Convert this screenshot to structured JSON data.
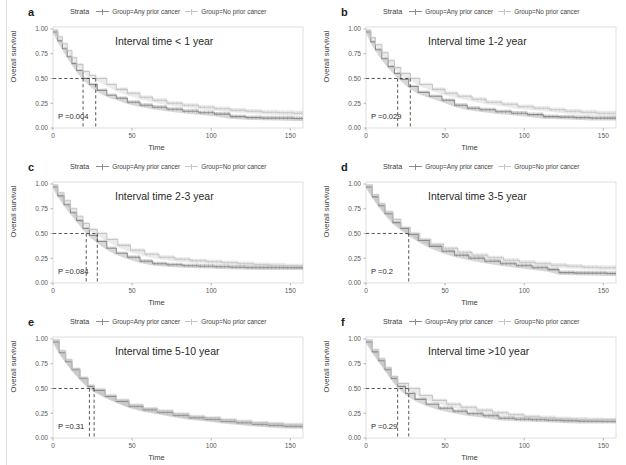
{
  "figure": {
    "type": "multi-panel-kaplan-meier",
    "panel_count": 6,
    "layout": "2 columns x 3 rows",
    "colors": {
      "any_prior_cancer": "#8d8d8d",
      "no_prior_cancer": "#c6c6c6",
      "axis": "#9a9a9a",
      "text": "#2a2a2a",
      "panel_border": "#d0d0d0",
      "dashed_guide": "#3a3a3a"
    }
  },
  "legend": {
    "title": "Strata",
    "items": [
      {
        "label": "Group=Any prior cancer",
        "color": "#8d8d8d",
        "key": "any-prior-cancer"
      },
      {
        "label": "Group=No prior cancer",
        "color": "#c6c6c6",
        "key": "no-prior-cancer"
      }
    ]
  },
  "axes": {
    "xlabel": "Time",
    "ylabel": "Overall survival",
    "xticks": [
      "0",
      "50",
      "100",
      "150"
    ],
    "xtick_values": [
      0,
      50,
      100,
      150
    ],
    "yticks": [
      "0.00",
      "0.25",
      "0.50",
      "0.75",
      "1.00"
    ],
    "ytick_values": [
      0.0,
      0.25,
      0.5,
      0.75,
      1.0
    ],
    "xlim": [
      0,
      158
    ],
    "ylim": [
      0,
      1.02
    ],
    "grid": false
  },
  "chart_data": [
    {
      "type": "line",
      "panel": "a",
      "letter": "a",
      "title": "Interval time < 1 year",
      "pvalue_label": "P =0.004",
      "pvalue": 0.004,
      "xlabel": "Time",
      "ylabel": "Overall survival",
      "xlim": [
        0,
        158
      ],
      "ylim": [
        0,
        1.02
      ],
      "median_markers": [
        19,
        27
      ],
      "median_level": 0.5,
      "series": [
        {
          "name": "Group=Any prior cancer",
          "color": "#8d8d8d",
          "x": [
            0,
            3,
            6,
            9,
            12,
            15,
            19,
            23,
            28,
            34,
            40,
            47,
            55,
            63,
            72,
            82,
            92,
            102,
            112,
            122,
            132,
            142,
            152,
            158
          ],
          "y": [
            0.97,
            0.88,
            0.8,
            0.72,
            0.65,
            0.58,
            0.5,
            0.44,
            0.38,
            0.33,
            0.3,
            0.26,
            0.23,
            0.21,
            0.19,
            0.17,
            0.155,
            0.14,
            0.115,
            0.105,
            0.1,
            0.1,
            0.095,
            0.095
          ]
        },
        {
          "name": "Group=No prior cancer",
          "color": "#c6c6c6",
          "x": [
            0,
            3,
            6,
            9,
            12,
            15,
            19,
            23,
            27,
            34,
            40,
            47,
            55,
            63,
            72,
            82,
            92,
            102,
            112,
            122,
            132,
            142,
            152,
            158
          ],
          "y": [
            0.99,
            0.92,
            0.85,
            0.78,
            0.71,
            0.64,
            0.57,
            0.53,
            0.5,
            0.44,
            0.39,
            0.35,
            0.31,
            0.28,
            0.25,
            0.23,
            0.21,
            0.195,
            0.18,
            0.17,
            0.16,
            0.155,
            0.15,
            0.15
          ]
        }
      ]
    },
    {
      "type": "line",
      "panel": "b",
      "letter": "b",
      "title": "Interval time 1-2 year",
      "pvalue_label": "P =0.029",
      "pvalue": 0.029,
      "xlabel": "Time",
      "ylabel": "Overall survival",
      "xlim": [
        0,
        158
      ],
      "ylim": [
        0,
        1.02
      ],
      "median_markers": [
        20,
        28
      ],
      "median_level": 0.5,
      "series": [
        {
          "name": "Group=Any prior cancer",
          "color": "#8d8d8d",
          "x": [
            0,
            3,
            6,
            10,
            14,
            18,
            22,
            27,
            33,
            40,
            48,
            56,
            64,
            72,
            82,
            92,
            102,
            112,
            122,
            132,
            142,
            152,
            158
          ],
          "y": [
            0.97,
            0.87,
            0.79,
            0.7,
            0.62,
            0.55,
            0.49,
            0.42,
            0.36,
            0.32,
            0.28,
            0.23,
            0.2,
            0.185,
            0.165,
            0.15,
            0.135,
            0.115,
            0.11,
            0.105,
            0.1,
            0.1,
            0.1
          ]
        },
        {
          "name": "Group=No prior cancer",
          "color": "#c6c6c6",
          "x": [
            0,
            3,
            6,
            10,
            14,
            18,
            22,
            28,
            34,
            42,
            50,
            58,
            67,
            76,
            86,
            96,
            106,
            116,
            126,
            136,
            146,
            158
          ],
          "y": [
            0.99,
            0.91,
            0.84,
            0.76,
            0.68,
            0.61,
            0.55,
            0.5,
            0.44,
            0.39,
            0.35,
            0.32,
            0.29,
            0.26,
            0.24,
            0.215,
            0.2,
            0.185,
            0.17,
            0.16,
            0.15,
            0.145
          ]
        }
      ]
    },
    {
      "type": "line",
      "panel": "c",
      "letter": "c",
      "title": "Interval time 2-3 year",
      "pvalue_label": "P =0.084",
      "pvalue": 0.084,
      "xlabel": "Time",
      "ylabel": "Overall survival",
      "xlim": [
        0,
        158
      ],
      "ylim": [
        0,
        1.02
      ],
      "median_markers": [
        21,
        28
      ],
      "median_level": 0.5,
      "series": [
        {
          "name": "Group=Any prior cancer",
          "color": "#8d8d8d",
          "x": [
            0,
            3,
            7,
            11,
            15,
            19,
            23,
            28,
            34,
            40,
            47,
            55,
            63,
            72,
            82,
            92,
            102,
            112,
            122,
            132,
            142,
            152,
            158
          ],
          "y": [
            0.97,
            0.88,
            0.79,
            0.71,
            0.63,
            0.55,
            0.48,
            0.42,
            0.35,
            0.3,
            0.26,
            0.22,
            0.195,
            0.185,
            0.175,
            0.17,
            0.165,
            0.16,
            0.155,
            0.155,
            0.155,
            0.155,
            0.155
          ]
        },
        {
          "name": "Group=No prior cancer",
          "color": "#c6c6c6",
          "x": [
            0,
            3,
            7,
            11,
            15,
            19,
            23,
            28,
            34,
            41,
            49,
            58,
            67,
            77,
            87,
            97,
            107,
            117,
            127,
            137,
            147,
            158
          ],
          "y": [
            0.99,
            0.91,
            0.83,
            0.75,
            0.67,
            0.6,
            0.54,
            0.5,
            0.44,
            0.38,
            0.33,
            0.29,
            0.26,
            0.24,
            0.225,
            0.215,
            0.205,
            0.195,
            0.185,
            0.18,
            0.17,
            0.165
          ]
        }
      ]
    },
    {
      "type": "line",
      "panel": "d",
      "letter": "d",
      "title": "Interval time 3-5 year",
      "pvalue_label": "P =0.2",
      "pvalue": 0.2,
      "xlabel": "Time",
      "ylabel": "Overall survival",
      "xlim": [
        0,
        158
      ],
      "ylim": [
        0,
        1.02
      ],
      "median_markers": [
        27
      ],
      "median_level": 0.5,
      "series": [
        {
          "name": "Group=Any prior cancer",
          "color": "#8d8d8d",
          "x": [
            0,
            4,
            8,
            12,
            17,
            22,
            27,
            33,
            40,
            48,
            56,
            65,
            75,
            85,
            95,
            105,
            115,
            122,
            132,
            142,
            152,
            158
          ],
          "y": [
            0.97,
            0.87,
            0.78,
            0.7,
            0.61,
            0.55,
            0.49,
            0.43,
            0.37,
            0.32,
            0.28,
            0.25,
            0.22,
            0.195,
            0.175,
            0.155,
            0.135,
            0.105,
            0.1,
            0.1,
            0.095,
            0.095
          ]
        },
        {
          "name": "Group=No prior cancer",
          "color": "#c6c6c6",
          "x": [
            0,
            4,
            8,
            12,
            17,
            22,
            28,
            34,
            41,
            49,
            58,
            67,
            77,
            87,
            97,
            107,
            117,
            127,
            137,
            147,
            158
          ],
          "y": [
            0.99,
            0.89,
            0.8,
            0.72,
            0.64,
            0.56,
            0.5,
            0.44,
            0.39,
            0.35,
            0.31,
            0.28,
            0.255,
            0.23,
            0.21,
            0.195,
            0.18,
            0.17,
            0.16,
            0.155,
            0.15
          ]
        }
      ]
    },
    {
      "type": "line",
      "panel": "e",
      "letter": "e",
      "title": "Interval time 5-10 year",
      "pvalue_label": "P =0.31",
      "pvalue": 0.31,
      "xlabel": "Time",
      "ylabel": "Overall survival",
      "xlim": [
        0,
        158
      ],
      "ylim": [
        0,
        1.02
      ],
      "median_markers": [
        23,
        26
      ],
      "median_level": 0.5,
      "series": [
        {
          "name": "Group=Any prior cancer",
          "color": "#8d8d8d",
          "x": [
            0,
            4,
            8,
            12,
            17,
            22,
            26,
            33,
            40,
            48,
            57,
            66,
            76,
            86,
            96,
            106,
            116,
            126,
            136,
            146,
            158
          ],
          "y": [
            0.97,
            0.86,
            0.77,
            0.69,
            0.6,
            0.52,
            0.48,
            0.42,
            0.37,
            0.32,
            0.285,
            0.26,
            0.23,
            0.205,
            0.19,
            0.17,
            0.155,
            0.14,
            0.13,
            0.12,
            0.115
          ]
        },
        {
          "name": "Group=No prior cancer",
          "color": "#c6c6c6",
          "x": [
            0,
            4,
            8,
            12,
            17,
            22,
            26,
            33,
            40,
            48,
            57,
            66,
            76,
            86,
            96,
            106,
            116,
            126,
            136,
            146,
            158
          ],
          "y": [
            0.99,
            0.88,
            0.79,
            0.7,
            0.61,
            0.53,
            0.49,
            0.43,
            0.38,
            0.33,
            0.295,
            0.27,
            0.24,
            0.215,
            0.2,
            0.18,
            0.165,
            0.15,
            0.14,
            0.13,
            0.125
          ]
        }
      ]
    },
    {
      "type": "line",
      "panel": "f",
      "letter": "f",
      "title": "Interval time >10 year",
      "pvalue_label": "P =0.29",
      "pvalue": 0.29,
      "xlabel": "Time",
      "ylabel": "Overall survival",
      "xlim": [
        0,
        158
      ],
      "ylim": [
        0,
        1.02
      ],
      "median_markers": [
        20,
        27
      ],
      "median_level": 0.5,
      "series": [
        {
          "name": "Group=Any prior cancer",
          "color": "#8d8d8d",
          "x": [
            0,
            4,
            8,
            12,
            16,
            20,
            25,
            31,
            38,
            46,
            55,
            64,
            74,
            84,
            94,
            104,
            114,
            124,
            134,
            144,
            158
          ],
          "y": [
            0.97,
            0.87,
            0.78,
            0.69,
            0.6,
            0.52,
            0.45,
            0.39,
            0.34,
            0.3,
            0.27,
            0.245,
            0.225,
            0.2,
            0.19,
            0.185,
            0.18,
            0.175,
            0.17,
            0.17,
            0.17
          ]
        },
        {
          "name": "Group=No prior cancer",
          "color": "#c6c6c6",
          "x": [
            0,
            4,
            8,
            12,
            16,
            20,
            27,
            34,
            42,
            51,
            60,
            70,
            80,
            90,
            100,
            110,
            120,
            130,
            140,
            150,
            158
          ],
          "y": [
            0.99,
            0.89,
            0.8,
            0.71,
            0.62,
            0.55,
            0.5,
            0.43,
            0.38,
            0.34,
            0.31,
            0.28,
            0.255,
            0.235,
            0.215,
            0.205,
            0.195,
            0.19,
            0.185,
            0.18,
            0.175
          ]
        }
      ]
    }
  ]
}
